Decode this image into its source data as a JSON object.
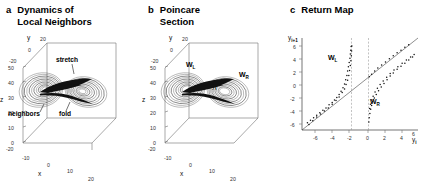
{
  "figure": {
    "panels": [
      {
        "letter": "a",
        "title": "Dynamics of Local Neighbors",
        "title_line1": "Dynamics of",
        "title_line2": "Local Neighbors",
        "type": "lorenz-attractor-3d",
        "annotations": [
          "stretch",
          "neighbors",
          "fold"
        ],
        "axes": {
          "x": {
            "label": "x",
            "ticks": [
              "-20",
              "-10",
              "0",
              "10",
              "20"
            ]
          },
          "y": {
            "label": "y",
            "ticks": [
              "-20",
              "0",
              "20"
            ]
          },
          "z": {
            "label": "z",
            "ticks": [
              "0",
              "10",
              "20",
              "30",
              "40",
              "50"
            ]
          }
        }
      },
      {
        "letter": "b",
        "title": "Poincare Section",
        "title_line1": "Poincare",
        "title_line2": "Section",
        "type": "lorenz-attractor-3d",
        "annotations": [
          "W_L",
          "W_R",
          "y_i"
        ],
        "axes": {
          "x": {
            "label": "x",
            "ticks": [
              "-20",
              "-10",
              "0",
              "10",
              "20"
            ]
          },
          "y": {
            "label": "y",
            "ticks": [
              "-20",
              "0",
              "20"
            ]
          },
          "z": {
            "label": "z",
            "ticks": [
              "0",
              "10",
              "20",
              "30",
              "40",
              "50"
            ]
          }
        }
      },
      {
        "letter": "c",
        "title": "Return Map",
        "title_line1": "Return Map",
        "title_line2": "",
        "type": "return-map",
        "annotations": [
          "W_L",
          "W_R"
        ],
        "axes": {
          "x": {
            "label": "y_i",
            "ticks": [
              "-6",
              "-4",
              "-2",
              "0",
              "2",
              "4",
              "6"
            ]
          },
          "y": {
            "label": "y_i+1",
            "ticks": [
              "-6",
              "-4",
              "-2",
              "0",
              "2",
              "4",
              "6"
            ]
          }
        }
      }
    ],
    "labels": {
      "stretch": "stretch",
      "neighbors": "neighbors",
      "fold": "fold",
      "w_left": "W",
      "w_left_sub": "L",
      "w_right": "W",
      "w_right_sub": "R",
      "y_i": "y",
      "y_i_sub": "i",
      "y_next": "y",
      "y_next_sub": "i+1",
      "axis_x": "x",
      "axis_y": "y",
      "axis_z": "z"
    },
    "colors": {
      "ink": "#111111",
      "axis": "#6e6e6e",
      "dash": "#9a9a9a",
      "background": "#ffffff"
    }
  },
  "chart_data": [
    {
      "type": "line",
      "title": "Dynamics of Local Neighbors",
      "panel": "a",
      "description": "Lorenz attractor trajectory in 3D showing stretching and folding of a local neighborhood",
      "xlabel": "x",
      "ylabel": "y",
      "zlabel": "z",
      "xlim": [
        -20,
        20
      ],
      "ylim": [
        -20,
        20
      ],
      "zlim": [
        0,
        50
      ],
      "xticks": [
        -20,
        -10,
        0,
        10,
        20
      ],
      "yticks": [
        -20,
        0,
        20
      ],
      "zticks": [
        0,
        10,
        20,
        30,
        40,
        50
      ],
      "grid": false,
      "legend": "none",
      "annotations": [
        {
          "text": "stretch",
          "x": 4,
          "y": 0,
          "z": 38
        },
        {
          "text": "neighbors",
          "x": -9,
          "y": 0,
          "z": 12
        },
        {
          "text": "fold",
          "x": 6,
          "y": 0,
          "z": 11
        }
      ]
    },
    {
      "type": "line",
      "title": "Poincare Section",
      "panel": "b",
      "description": "Lorenz attractor with Poincare section branches W_L and W_R and section coordinate y_i",
      "xlabel": "x",
      "ylabel": "y",
      "zlabel": "z",
      "xlim": [
        -20,
        20
      ],
      "ylim": [
        -20,
        20
      ],
      "zlim": [
        0,
        50
      ],
      "xticks": [
        -20,
        -10,
        0,
        10,
        20
      ],
      "yticks": [
        -20,
        0,
        20
      ],
      "zticks": [
        0,
        10,
        20,
        30,
        40,
        50
      ],
      "grid": false,
      "legend": "none",
      "annotations": [
        {
          "text": "W_L",
          "x": -7,
          "y": 0,
          "z": 43
        },
        {
          "text": "W_R",
          "x": 13,
          "y": 0,
          "z": 38
        },
        {
          "text": "y_i",
          "x": 2,
          "y": 0,
          "z": 31
        }
      ]
    },
    {
      "type": "scatter",
      "title": "Return Map",
      "panel": "c",
      "description": "First-return map y_i+1 vs y_i with two branches W_L and W_R, dashed vertical asymptotes and identity line",
      "xlabel": "y_i",
      "ylabel": "y_i+1",
      "xlim": [
        -7.5,
        7.5
      ],
      "ylim": [
        -7.5,
        7.5
      ],
      "xticks": [
        -6,
        -4,
        -2,
        0,
        2,
        4,
        6
      ],
      "yticks": [
        -6,
        -4,
        -2,
        0,
        2,
        4,
        6
      ],
      "grid": false,
      "legend": "none",
      "asymptotes_x": [
        -1.1,
        1.1
      ],
      "identity_line": true,
      "series": [
        {
          "name": "W_L",
          "points": [
            [
              -6.8,
              -6.3
            ],
            [
              -6.4,
              -5.9
            ],
            [
              -6.0,
              -5.5
            ],
            [
              -5.6,
              -5.1
            ],
            [
              -5.2,
              -4.7
            ],
            [
              -4.8,
              -4.3
            ],
            [
              -4.4,
              -3.9
            ],
            [
              -4.0,
              -3.4
            ],
            [
              -3.6,
              -3.0
            ],
            [
              -3.3,
              -2.6
            ],
            [
              -3.0,
              -2.2
            ],
            [
              -2.7,
              -1.7
            ],
            [
              -2.45,
              -1.2
            ],
            [
              -2.2,
              -0.6
            ],
            [
              -2.0,
              0.0
            ],
            [
              -1.85,
              0.7
            ],
            [
              -1.7,
              1.4
            ],
            [
              -1.6,
              2.1
            ],
            [
              -1.5,
              2.8
            ],
            [
              -1.4,
              3.5
            ],
            [
              -1.3,
              4.2
            ],
            [
              -1.25,
              4.9
            ],
            [
              -1.2,
              5.5
            ],
            [
              -1.15,
              6.1
            ]
          ]
        },
        {
          "name": "W_L-lower",
          "points": [
            [
              -6.6,
              -6.6
            ],
            [
              -6.1,
              -6.0
            ],
            [
              -5.6,
              -5.4
            ],
            [
              -5.1,
              -4.9
            ],
            [
              -4.6,
              -4.4
            ],
            [
              -4.1,
              -3.9
            ],
            [
              -3.6,
              -3.3
            ],
            [
              -3.1,
              -2.7
            ],
            [
              -2.7,
              -2.1
            ],
            [
              -2.3,
              -1.4
            ],
            [
              -2.0,
              -0.8
            ],
            [
              -1.8,
              -0.1
            ],
            [
              -1.6,
              0.6
            ],
            [
              -1.45,
              1.4
            ],
            [
              -1.35,
              2.2
            ],
            [
              -1.25,
              3.0
            ],
            [
              -1.18,
              3.8
            ],
            [
              -1.12,
              4.6
            ],
            [
              -1.08,
              5.4
            ],
            [
              -1.05,
              6.2
            ]
          ]
        },
        {
          "name": "W_R",
          "points": [
            [
              1.15,
              -6.2
            ],
            [
              1.2,
              -5.5
            ],
            [
              1.28,
              -4.8
            ],
            [
              1.38,
              -4.1
            ],
            [
              1.5,
              -3.5
            ],
            [
              1.65,
              -2.9
            ],
            [
              1.85,
              -2.3
            ],
            [
              2.1,
              -1.7
            ],
            [
              2.4,
              -1.1
            ],
            [
              2.75,
              -0.5
            ],
            [
              3.1,
              0.1
            ],
            [
              3.5,
              0.7
            ],
            [
              3.9,
              1.3
            ],
            [
              4.3,
              1.8
            ],
            [
              4.8,
              2.4
            ],
            [
              5.3,
              2.9
            ],
            [
              5.8,
              3.4
            ],
            [
              6.3,
              3.9
            ],
            [
              6.8,
              4.4
            ]
          ]
        },
        {
          "name": "W_R-upper",
          "points": [
            [
              1.25,
              -4.0
            ],
            [
              1.35,
              -3.3
            ],
            [
              1.5,
              -2.6
            ],
            [
              1.7,
              -2.0
            ],
            [
              1.95,
              -1.3
            ],
            [
              2.25,
              -0.7
            ],
            [
              2.6,
              -0.1
            ],
            [
              3.0,
              0.5
            ],
            [
              3.45,
              1.1
            ],
            [
              3.9,
              1.7
            ],
            [
              4.4,
              2.3
            ],
            [
              4.9,
              2.8
            ],
            [
              5.45,
              3.4
            ],
            [
              6.0,
              3.9
            ],
            [
              6.55,
              4.4
            ],
            [
              7.0,
              4.8
            ]
          ]
        },
        {
          "name": "inner-branch",
          "points": [
            [
              1.2,
              1.2
            ],
            [
              1.5,
              1.6
            ],
            [
              1.9,
              2.1
            ],
            [
              2.3,
              2.6
            ],
            [
              2.8,
              3.1
            ],
            [
              3.3,
              3.6
            ],
            [
              3.8,
              4.1
            ],
            [
              4.3,
              4.6
            ],
            [
              4.8,
              5.1
            ],
            [
              5.3,
              5.5
            ],
            [
              5.8,
              6.0
            ],
            [
              6.3,
              6.4
            ]
          ]
        }
      ]
    }
  ]
}
